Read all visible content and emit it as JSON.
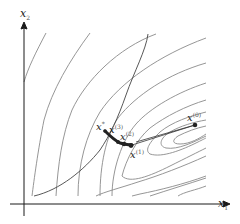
{
  "figure": {
    "type": "optimization-contour-diagram",
    "axes": {
      "x_label": "x",
      "x_sub": "1",
      "y_label": "x",
      "y_sub": "2"
    },
    "colors": {
      "contour": "#8a8a8a",
      "axis": "#1a1a1a",
      "path": "#333333",
      "point": "#222222",
      "constraint": "#444444"
    },
    "points": [
      {
        "id": "x0",
        "label": "x",
        "sup": "(0)"
      },
      {
        "id": "x1",
        "label": "x",
        "sup": "(1)"
      },
      {
        "id": "x2",
        "label": "x",
        "sup": "(2)"
      },
      {
        "id": "x3",
        "label": "x",
        "sup": "(3)"
      },
      {
        "id": "xstar",
        "label": "x",
        "sup": "*"
      }
    ]
  }
}
